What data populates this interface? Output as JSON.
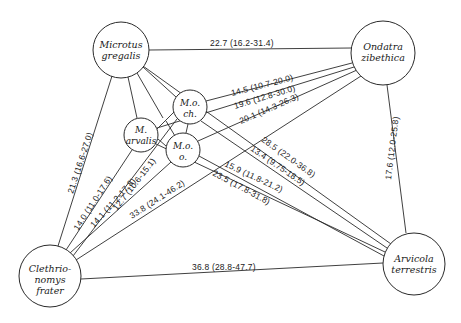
{
  "diagram": {
    "type": "distance-network",
    "nodes": [
      {
        "id": "mg",
        "lines": [
          "Microtus",
          "gregalis"
        ],
        "cx": 121,
        "cy": 50,
        "r": 28
      },
      {
        "id": "oz",
        "lines": [
          "Ondatra",
          "zibethica"
        ],
        "cx": 383,
        "cy": 53,
        "r": 32
      },
      {
        "id": "cf",
        "lines": [
          "Clethrio-",
          "nomys",
          "frater"
        ],
        "cx": 50,
        "cy": 276,
        "r": 31
      },
      {
        "id": "at",
        "lines": [
          "Arvicola",
          "terrestris"
        ],
        "cx": 414,
        "cy": 264,
        "r": 31
      },
      {
        "id": "moch",
        "lines": [
          "M.o.",
          "ch."
        ],
        "cx": 190,
        "cy": 107,
        "r": 17
      },
      {
        "id": "ma",
        "lines": [
          "M.",
          "arvalis"
        ],
        "cx": 141,
        "cy": 135,
        "r": 17
      },
      {
        "id": "moo",
        "lines": [
          "M.o.",
          "o."
        ],
        "cx": 183,
        "cy": 150,
        "r": 17
      }
    ],
    "edges": [
      {
        "from": "mg",
        "to": "oz",
        "label": "22.7 (16.2-31.4)"
      },
      {
        "from": "moch",
        "to": "oz",
        "label": "14.5 (10.7-20.0)"
      },
      {
        "from": "ma",
        "to": "oz",
        "label": "19.6 (12.8-30.0)"
      },
      {
        "from": "moo",
        "to": "oz",
        "label": "20.1 (14.3-26.3)"
      },
      {
        "from": "mg",
        "to": "at",
        "label": "28.5 (22.0-36.8)"
      },
      {
        "from": "moch",
        "to": "at",
        "label": "13.4 (9.75-18.5)"
      },
      {
        "from": "ma",
        "to": "at",
        "label": "15.9 (11.8-21.2)"
      },
      {
        "from": "moo",
        "to": "at",
        "label": "23.5 (17.8-31.8)"
      },
      {
        "from": "oz",
        "to": "at",
        "label": "17.6 (12.0-25.8)"
      },
      {
        "from": "mg",
        "to": "cf",
        "label": "21.3 (16.6-27.0)"
      },
      {
        "from": "ma",
        "to": "cf",
        "label": "14.0 (11.0-17.6)"
      },
      {
        "from": "moo",
        "to": "cf",
        "label": "14.1 (11.2-17.8)"
      },
      {
        "from": "moch",
        "to": "cf",
        "label": "12.7 (10.6-15.1)"
      },
      {
        "from": "oz",
        "to": "cf",
        "label": "33.8 (24.1-46.2)"
      },
      {
        "from": "cf",
        "to": "at",
        "label": "36.8 (28.8-47.7)"
      }
    ]
  }
}
